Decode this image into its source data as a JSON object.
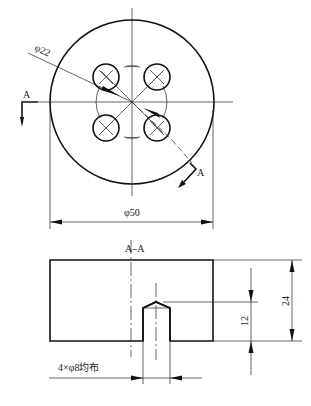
{
  "drawing": {
    "top_view": {
      "outer_diameter_label": "φ50",
      "bolt_circle_label": "φ22",
      "section_mark_left": "A",
      "section_mark_right": "A",
      "hole_count": 4
    },
    "section_view": {
      "title": "A–A",
      "height_label": "24",
      "hole_depth_label": "12",
      "hole_note": "4×φ8均布"
    },
    "colors": {
      "line": "#111111",
      "background": "#ffffff"
    }
  }
}
